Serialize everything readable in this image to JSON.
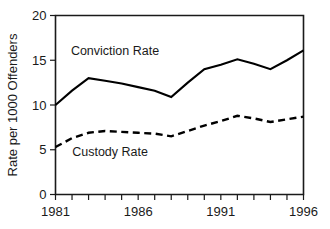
{
  "chart_data": {
    "type": "line",
    "title": "",
    "subtitle": "",
    "xlabel": "",
    "ylabel": "Rate per 1000 Offenders",
    "xlim": [
      1981,
      1996
    ],
    "ylim": [
      0,
      20
    ],
    "grid": false,
    "legend_position": "inline-annotations",
    "x": [
      1981,
      1982,
      1983,
      1984,
      1985,
      1986,
      1987,
      1988,
      1989,
      1990,
      1991,
      1992,
      1993,
      1994,
      1995,
      1996
    ],
    "x_tick_labels": [
      "1981",
      "1986",
      "1991",
      "1996"
    ],
    "x_tick_values": [
      1981,
      1986,
      1991,
      1996
    ],
    "y_tick_labels": [
      "0",
      "5",
      "10",
      "15",
      "20"
    ],
    "y_tick_values": [
      0,
      5,
      10,
      15,
      20
    ],
    "series": [
      {
        "name": "Conviction Rate",
        "style": "solid",
        "color": "#000000",
        "values": [
          10.0,
          11.6,
          13.0,
          12.7,
          12.4,
          12.0,
          11.6,
          10.9,
          12.5,
          14.0,
          14.5,
          15.1,
          14.6,
          14.0,
          15.0,
          16.1
        ]
      },
      {
        "name": "Custody Rate",
        "style": "dashed",
        "color": "#000000",
        "values": [
          5.3,
          6.3,
          6.9,
          7.1,
          7.0,
          6.9,
          6.8,
          6.5,
          7.1,
          7.7,
          8.2,
          8.8,
          8.5,
          8.1,
          8.4,
          8.7
        ]
      }
    ],
    "annotations": [
      {
        "text": "Conviction Rate",
        "x": 1984.6,
        "y": 15.6
      },
      {
        "text": "Custody Rate",
        "x": 1984.3,
        "y": 4.3
      }
    ]
  },
  "axes": {
    "y_title": "Rate per 1000 Offenders"
  }
}
